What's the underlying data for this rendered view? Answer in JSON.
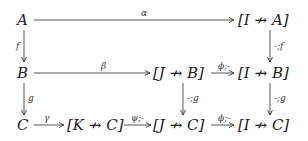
{
  "nodes": {
    "A": "A",
    "IA": "[I ↛ A]",
    "B": "B",
    "JB": "[J ↛ B]",
    "IB": "[I ↛ B]",
    "C": "C",
    "KC": "[K ↛ C]",
    "JC": "[J ↛ C]",
    "IC": "[I ↛ C]"
  },
  "arrows": {
    "alpha": "α",
    "f": "f",
    "neg_f": "-;f",
    "beta": "β",
    "phi_B": "ϕ;-",
    "g": "g",
    "neg_g_J": "-;g",
    "neg_g_I": "-;g",
    "gamma": "γ",
    "psi": "ψ;-",
    "phi_C": "ϕ;-"
  }
}
